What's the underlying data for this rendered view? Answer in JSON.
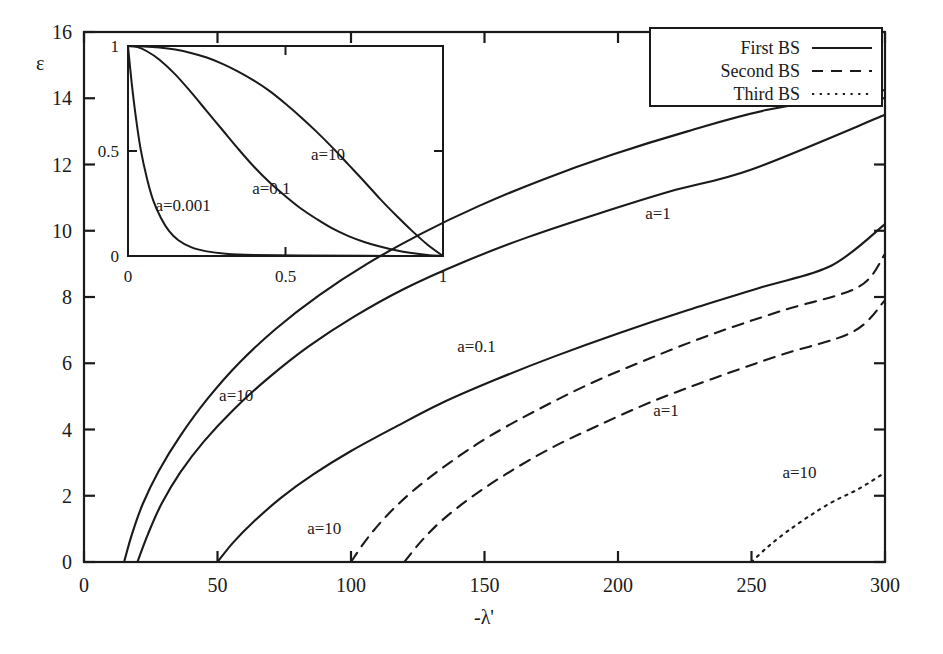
{
  "chart_data": {
    "type": "line",
    "title": "",
    "xlabel": "-λ'",
    "ylabel": "ε",
    "xlim": [
      0,
      300
    ],
    "ylim": [
      0,
      16
    ],
    "xticks": [
      0,
      50,
      100,
      150,
      200,
      250,
      300
    ],
    "xtick_labels": [
      "0",
      "50",
      "100",
      "150",
      "200",
      "250",
      "300"
    ],
    "yticks": [
      0,
      2,
      4,
      6,
      8,
      10,
      12,
      14,
      16
    ],
    "ytick_labels": [
      "0",
      "2",
      "4",
      "6",
      "8",
      "10",
      "12",
      "14",
      "16"
    ],
    "grid": false,
    "legend_position": "top-right",
    "legend": [
      {
        "label": "First BS",
        "style": "solid"
      },
      {
        "label": "Second BS",
        "style": "dashed"
      },
      {
        "label": "Third BS",
        "style": "dotted"
      }
    ],
    "series": [
      {
        "name": "First BS, a=10",
        "style": "solid",
        "annotation": "a=10",
        "annotation_xy": [
          57,
          4.85
        ],
        "points": [
          [
            15,
            0
          ],
          [
            18,
            0.85
          ],
          [
            22,
            1.75
          ],
          [
            28,
            2.75
          ],
          [
            36,
            3.8
          ],
          [
            46,
            4.9
          ],
          [
            58,
            6.0
          ],
          [
            72,
            7.05
          ],
          [
            88,
            8.05
          ],
          [
            106,
            9.0
          ],
          [
            126,
            9.9
          ],
          [
            148,
            10.75
          ],
          [
            172,
            11.55
          ],
          [
            198,
            12.3
          ],
          [
            226,
            13.0
          ],
          [
            256,
            13.65
          ],
          [
            300,
            14.25
          ]
        ]
      },
      {
        "name": "First BS, a=1",
        "style": "solid",
        "annotation": "a=1",
        "annotation_xy": [
          215,
          10.35
        ],
        "points": [
          [
            20,
            0
          ],
          [
            24,
            0.85
          ],
          [
            29,
            1.75
          ],
          [
            36,
            2.7
          ],
          [
            45,
            3.65
          ],
          [
            56,
            4.6
          ],
          [
            69,
            5.55
          ],
          [
            84,
            6.5
          ],
          [
            101,
            7.4
          ],
          [
            120,
            8.25
          ],
          [
            142,
            9.05
          ],
          [
            166,
            9.8
          ],
          [
            192,
            10.5
          ],
          [
            220,
            11.2
          ],
          [
            250,
            11.85
          ],
          [
            300,
            13.5
          ]
        ]
      },
      {
        "name": "First BS, a=0.1",
        "style": "solid",
        "annotation": "a=0.1",
        "annotation_xy": [
          147,
          6.35
        ],
        "points": [
          [
            50,
            0
          ],
          [
            56,
            0.6
          ],
          [
            64,
            1.25
          ],
          [
            74,
            1.95
          ],
          [
            86,
            2.65
          ],
          [
            100,
            3.35
          ],
          [
            116,
            4.05
          ],
          [
            134,
            4.8
          ],
          [
            154,
            5.5
          ],
          [
            176,
            6.2
          ],
          [
            200,
            6.9
          ],
          [
            226,
            7.6
          ],
          [
            254,
            8.3
          ],
          [
            280,
            8.95
          ],
          [
            300,
            10.2
          ]
        ]
      },
      {
        "name": "Second BS, a=10",
        "style": "dashed",
        "annotation": "a=10",
        "annotation_xy": [
          90,
          0.85
        ],
        "points": [
          [
            100,
            0
          ],
          [
            106,
            0.7
          ],
          [
            114,
            1.45
          ],
          [
            124,
            2.2
          ],
          [
            137,
            3.0
          ],
          [
            152,
            3.8
          ],
          [
            170,
            4.6
          ],
          [
            190,
            5.4
          ],
          [
            212,
            6.15
          ],
          [
            236,
            6.9
          ],
          [
            262,
            7.6
          ],
          [
            290,
            8.3
          ],
          [
            300,
            9.3
          ]
        ]
      },
      {
        "name": "Second BS, a=1",
        "style": "dashed",
        "annotation": "a=1",
        "annotation_xy": [
          218,
          4.4
        ],
        "points": [
          [
            120,
            0
          ],
          [
            126,
            0.6
          ],
          [
            134,
            1.25
          ],
          [
            145,
            1.95
          ],
          [
            158,
            2.65
          ],
          [
            174,
            3.4
          ],
          [
            192,
            4.1
          ],
          [
            213,
            4.85
          ],
          [
            236,
            5.55
          ],
          [
            261,
            6.25
          ],
          [
            288,
            6.95
          ],
          [
            300,
            7.9
          ]
        ]
      },
      {
        "name": "Third BS, a=10",
        "style": "dotted",
        "annotation": "a=10",
        "annotation_xy": [
          268,
          2.55
        ],
        "points": [
          [
            250,
            0
          ],
          [
            256,
            0.45
          ],
          [
            263,
            0.9
          ],
          [
            271,
            1.35
          ],
          [
            280,
            1.8
          ],
          [
            290,
            2.2
          ],
          [
            300,
            2.7
          ]
        ]
      }
    ]
  },
  "inset": {
    "xlim": [
      0,
      1
    ],
    "ylim": [
      0,
      1
    ],
    "xticks": [
      0,
      0.5,
      1
    ],
    "xtick_labels": [
      "0",
      "0.5",
      "1"
    ],
    "yticks": [
      0,
      0.5,
      1
    ],
    "ytick_labels": [
      "0",
      "0.5",
      "1"
    ],
    "type": "line",
    "series": [
      {
        "name": "a=0.001",
        "annotation": "a=0.001",
        "annotation_xy": [
          0.175,
          0.215
        ],
        "points": [
          [
            0,
            1
          ],
          [
            0.012,
            0.82
          ],
          [
            0.025,
            0.66
          ],
          [
            0.04,
            0.51
          ],
          [
            0.06,
            0.37
          ],
          [
            0.08,
            0.265
          ],
          [
            0.105,
            0.18
          ],
          [
            0.13,
            0.12
          ],
          [
            0.16,
            0.075
          ],
          [
            0.2,
            0.042
          ],
          [
            0.25,
            0.022
          ],
          [
            0.31,
            0.011
          ],
          [
            0.4,
            0.005
          ],
          [
            0.55,
            0.002
          ],
          [
            0.75,
            0.001
          ],
          [
            1,
            0
          ]
        ]
      },
      {
        "name": "a=0.1",
        "annotation": "a=0.1",
        "annotation_xy": [
          0.455,
          0.295
        ],
        "points": [
          [
            0,
            1
          ],
          [
            0.03,
            0.995
          ],
          [
            0.06,
            0.975
          ],
          [
            0.1,
            0.935
          ],
          [
            0.15,
            0.865
          ],
          [
            0.2,
            0.78
          ],
          [
            0.25,
            0.69
          ],
          [
            0.3,
            0.6
          ],
          [
            0.35,
            0.51
          ],
          [
            0.4,
            0.425
          ],
          [
            0.45,
            0.35
          ],
          [
            0.5,
            0.285
          ],
          [
            0.55,
            0.225
          ],
          [
            0.6,
            0.175
          ],
          [
            0.65,
            0.13
          ],
          [
            0.7,
            0.095
          ],
          [
            0.75,
            0.067
          ],
          [
            0.8,
            0.045
          ],
          [
            0.85,
            0.027
          ],
          [
            0.9,
            0.014
          ],
          [
            0.95,
            0.005
          ],
          [
            1,
            0
          ]
        ]
      },
      {
        "name": "a=10",
        "annotation": "a=10",
        "annotation_xy": [
          0.635,
          0.455
        ],
        "points": [
          [
            0,
            1
          ],
          [
            0.05,
            0.998
          ],
          [
            0.1,
            0.993
          ],
          [
            0.15,
            0.983
          ],
          [
            0.2,
            0.967
          ],
          [
            0.25,
            0.945
          ],
          [
            0.3,
            0.915
          ],
          [
            0.35,
            0.878
          ],
          [
            0.4,
            0.835
          ],
          [
            0.45,
            0.785
          ],
          [
            0.5,
            0.725
          ],
          [
            0.55,
            0.66
          ],
          [
            0.6,
            0.59
          ],
          [
            0.65,
            0.515
          ],
          [
            0.7,
            0.435
          ],
          [
            0.75,
            0.355
          ],
          [
            0.8,
            0.272
          ],
          [
            0.85,
            0.195
          ],
          [
            0.9,
            0.122
          ],
          [
            0.95,
            0.055
          ],
          [
            1,
            0
          ]
        ]
      }
    ]
  },
  "colors": {
    "ink": "#1a1a1a",
    "background": "#ffffff"
  }
}
